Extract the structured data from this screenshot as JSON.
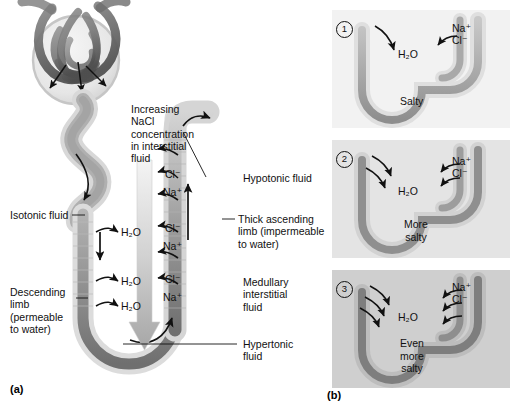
{
  "figure": {
    "panel_a_letter": "(a)",
    "panel_b_letter": "(b)"
  },
  "panel_a": {
    "labels": {
      "gradient": "Increasing\nNaCl\nconcentration\nin interstitial\nfluid",
      "hypotonic": "Hypotonic fluid",
      "isotonic": "Isotonic fluid",
      "thick_ascending": "Thick ascending\nlimb (impermeable\nto water)",
      "descending": "Descending\nlimb\n(permeable\nto water)",
      "medullary": "Medullary\ninterstitial\nfluid",
      "hypertonic": "Hypertonic\nfluid"
    },
    "water_labels": [
      "H₂O",
      "H₂O",
      "H₂O"
    ],
    "ion_pairs": [
      {
        "cl": "Cl⁻",
        "na": "Na⁺"
      },
      {
        "cl": "Cl⁻",
        "na": "Na⁺"
      },
      {
        "cl": "Cl⁻",
        "na": "Na⁺"
      }
    ]
  },
  "panel_b": {
    "steps": [
      {
        "number": "1",
        "water": "H₂O",
        "na": "Na⁺",
        "cl": "Cl⁻",
        "salt_text": "Salty",
        "water_arrows": 1,
        "ion_arrows": 1,
        "bg": "#f2f2f2"
      },
      {
        "number": "2",
        "water": "H₂O",
        "na": "Na⁺",
        "cl": "Cl⁻",
        "salt_text": "More\nsalty",
        "water_arrows": 2,
        "ion_arrows": 2,
        "bg": "#e4e4e4"
      },
      {
        "number": "3",
        "water": "H₂O",
        "na": "Na⁺",
        "cl": "Cl⁻",
        "salt_text": "Even\nmore\nsalty",
        "water_arrows": 3,
        "ion_arrows": 3,
        "bg": "#cfcfcf"
      }
    ]
  },
  "colors": {
    "tubule_outline": "#9a9a9a",
    "tubule_light": "#e8e8e8",
    "tubule_dark": "#6e6e6e",
    "arrow": "#111111",
    "gradient_top": "#f0f0f0",
    "gradient_bottom": "#a8a8a8"
  }
}
